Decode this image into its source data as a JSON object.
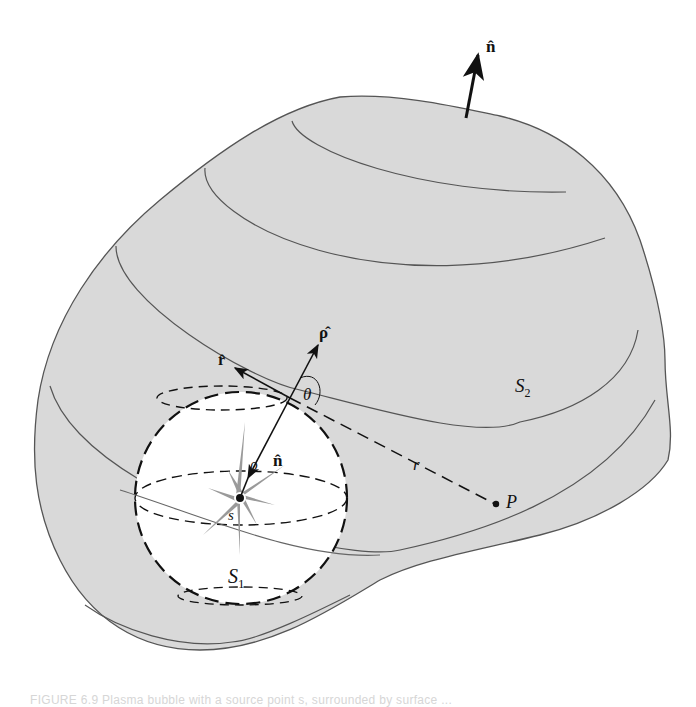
{
  "figure": {
    "labels": {
      "n_hat_outer": "n̂",
      "rho_hat": "ρ̂",
      "r_hat": "r̂",
      "theta": "θ",
      "n_hat_inner": "n̂",
      "rho": "ρ",
      "s": "s",
      "r": "r",
      "P": "P",
      "S1": "S",
      "S1_sub": "1",
      "S2": "S",
      "S2_sub": "2"
    },
    "colors": {
      "surface_fill": "#d9d9d9",
      "surface_stroke": "#555555",
      "sphere_fill": "#ffffff",
      "source_star": "#9a9a9a",
      "ink": "#111111"
    }
  },
  "caption": {
    "text": "FIGURE 6.9  Plasma bubble with a source point s, surrounded by surface ..."
  }
}
